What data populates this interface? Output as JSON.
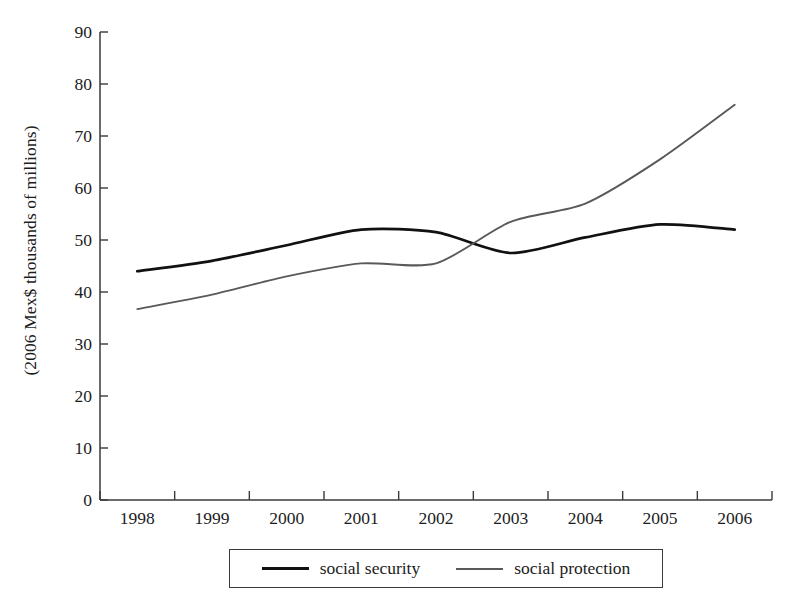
{
  "chart_data": {
    "type": "line",
    "title": "",
    "xlabel": "",
    "ylabel": "(2006 Mex$ thousands of millions)",
    "categories": [
      "1998",
      "1999",
      "2000",
      "2001",
      "2002",
      "2003",
      "2004",
      "2005",
      "2006"
    ],
    "series": [
      {
        "name": "social security",
        "color": "#111111",
        "values": [
          44,
          46,
          49,
          52,
          51.5,
          47.5,
          50.5,
          53,
          52
        ]
      },
      {
        "name": "social protection",
        "color": "#595959",
        "values": [
          36.7,
          39.5,
          43,
          45.5,
          45.5,
          53.5,
          57,
          65.5,
          76
        ]
      }
    ],
    "ylim": [
      0,
      90
    ],
    "yticks": [
      0,
      10,
      20,
      30,
      40,
      50,
      60,
      70,
      80,
      90
    ],
    "ytick_labels": [
      "0",
      "10",
      "20",
      "30",
      "40",
      "50",
      "60",
      "70",
      "80",
      "90"
    ],
    "grid": false,
    "legend_position": "bottom"
  },
  "axes": {
    "y_label": "(2006 Mex$ thousands of millions)"
  },
  "legend": {
    "entries": [
      {
        "label": "social security",
        "swatch": "thick-black-line"
      },
      {
        "label": "social protection",
        "swatch": "thin-gray-line"
      }
    ]
  }
}
